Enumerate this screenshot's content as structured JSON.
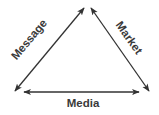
{
  "diagram": {
    "type": "triangle of bidirectional arrows",
    "nodes": [
      "top",
      "bottom-left",
      "bottom-right"
    ],
    "edges": [
      {
        "label": "Message",
        "from": "top",
        "to": "bottom-left",
        "direction": "both"
      },
      {
        "label": "Market",
        "from": "top",
        "to": "bottom-right",
        "direction": "both"
      },
      {
        "label": "Media",
        "from": "bottom-left",
        "to": "bottom-right",
        "direction": "both"
      }
    ],
    "colors": {
      "line": "#333333",
      "text": "#3a3a3a",
      "background": "#ffffff"
    }
  }
}
